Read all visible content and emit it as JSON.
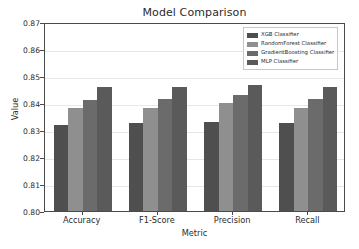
{
  "chart_data": {
    "type": "bar",
    "title": "Model Comparison",
    "xlabel": "Metric",
    "ylabel": "Value",
    "categories": [
      "Accuracy",
      "F1-Score",
      "Precision",
      "Recall"
    ],
    "series": [
      {
        "name": "XGB Classifier",
        "color": "#4f4f4f",
        "values": [
          0.832,
          0.8325,
          0.833,
          0.8325
        ]
      },
      {
        "name": "RandomForest Classifier",
        "color": "#8f8f8f",
        "values": [
          0.838,
          0.838,
          0.84,
          0.838
        ]
      },
      {
        "name": "GradientBoosting Classifier",
        "color": "#6b6b6b",
        "values": [
          0.841,
          0.8415,
          0.843,
          0.8415
        ]
      },
      {
        "name": "MLP Classifier",
        "color": "#5a5a5a",
        "values": [
          0.846,
          0.846,
          0.8465,
          0.846
        ]
      }
    ],
    "ylim": [
      0.8,
      0.87
    ],
    "yticks": [
      "0.80",
      "0.81",
      "0.82",
      "0.83",
      "0.84",
      "0.85",
      "0.86",
      "0.87"
    ],
    "ytick_values": [
      0.8,
      0.81,
      0.82,
      0.83,
      0.84,
      0.85,
      0.86,
      0.87
    ],
    "grid": true,
    "legend_position": "upper right"
  }
}
